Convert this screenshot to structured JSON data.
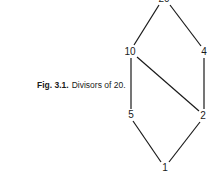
{
  "caption": {
    "figure_label": "Fig. 3.1.",
    "text": "Divisors of 20."
  },
  "diagram": {
    "type": "hasse",
    "nodes": [
      {
        "id": "20",
        "label": "20",
        "x": 164,
        "y": -1
      },
      {
        "id": "10",
        "label": "10",
        "x": 130,
        "y": 52
      },
      {
        "id": "4",
        "label": "4",
        "x": 204,
        "y": 52
      },
      {
        "id": "5",
        "label": "5",
        "x": 131,
        "y": 115
      },
      {
        "id": "2",
        "label": "2",
        "x": 203,
        "y": 116
      },
      {
        "id": "1",
        "label": "1",
        "x": 165,
        "y": 168
      }
    ],
    "edges": [
      [
        "20",
        "10"
      ],
      [
        "20",
        "4"
      ],
      [
        "10",
        "5"
      ],
      [
        "10",
        "2"
      ],
      [
        "4",
        "2"
      ],
      [
        "5",
        "1"
      ],
      [
        "2",
        "1"
      ]
    ]
  }
}
